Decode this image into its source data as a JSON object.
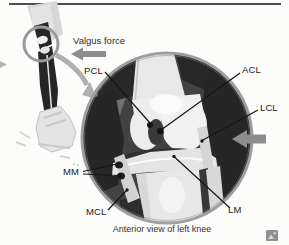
{
  "figure": {
    "force_label": "Valgus force",
    "caption": "Anterior view of left knee",
    "labels": {
      "pcl": "PCL",
      "acl": "ACL",
      "lcl": "LCL",
      "mm": "MM",
      "mcl": "MCL",
      "lm": "LM"
    },
    "icons": {
      "valgus_arrow": "left-block-arrow",
      "lateral_force_arrow": "left-block-arrow",
      "rotation_arrow": "curved-arrow",
      "thumbnail": "image-thumbnail"
    },
    "colors": {
      "force_arrow": "#8d8d8d",
      "rotation_arrow": "#b0b0b0",
      "ring": "#9e9e9e",
      "inset_bg": "#424242",
      "label_text": "#1b1b1b",
      "top_rule": "#4d4d4d"
    }
  }
}
